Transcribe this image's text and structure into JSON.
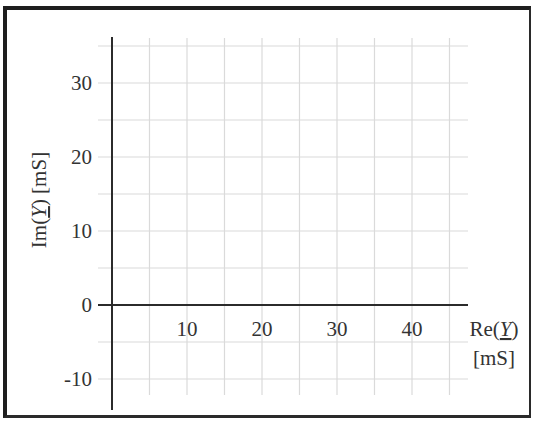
{
  "chart_data": {
    "type": "scatter",
    "title": "",
    "xlabel": "Re(Y) [mS]",
    "ylabel": "Im(Y) [mS]",
    "xlabel_parts": {
      "prefix": "Re(",
      "var": "Y",
      "suffix": ")",
      "unit": "[mS]"
    },
    "ylabel_parts": {
      "prefix": "Im(",
      "var": "Y",
      "suffix": ")",
      "unit": "[mS]"
    },
    "x_ticks": [
      10,
      20,
      30,
      40
    ],
    "y_ticks": [
      -10,
      0,
      10,
      20,
      30
    ],
    "x_tick_labels": [
      "10",
      "20",
      "30",
      "40"
    ],
    "y_tick_labels": [
      "-10",
      "0",
      "10",
      "20",
      "30"
    ],
    "xlim": [
      -2,
      47
    ],
    "ylim": [
      -12,
      35
    ],
    "grid": true,
    "grid_step": 5,
    "series": [],
    "legend": null,
    "colors": {
      "axis": "#2b2b2b",
      "grid": "#d9d9d9",
      "text": "#333333",
      "frame": "#1e1e1e"
    }
  }
}
